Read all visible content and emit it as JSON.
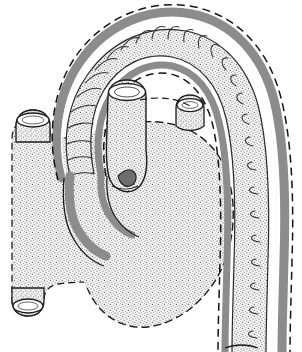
{
  "figure": {
    "title": "Anatomical line drawing of heart with aortic arch",
    "background_color": "#ffffff",
    "width": 302,
    "height": 352
  },
  "style": {
    "outline_color": "#1a1a1a",
    "vessel_wall_gray": "#8f8f8f",
    "vessel_wall_gray_dark": "#7a7a7a",
    "stipple_color": "#6b6b6b",
    "stipple_background": "#f2f2f2",
    "dashed_outline_color": "#141414",
    "rung_color": "#3a3a3a",
    "line_width_outline": 1.4,
    "line_width_rung": 1.0,
    "dash_pattern": "7,4"
  },
  "structures": [
    {
      "id": "heart-body",
      "label": "Heart chamber body",
      "fill": "stipple",
      "outline": "dashed",
      "description": "Large stippled silhouette occupying the left and lower-centre of the frame"
    },
    {
      "id": "left-upper-stump",
      "label": "Upper left vessel stump",
      "fill": "stipple",
      "outline": "dashed",
      "description": "Short tubular cut stump projecting from upper left of heart with elliptical open end"
    },
    {
      "id": "left-lower-stump",
      "label": "Lower left vessel stump",
      "fill": "stipple",
      "outline": "dashed",
      "description": "Short tubular cut stump projecting from lower left of heart with elliptical open end"
    },
    {
      "id": "pulmonary-trunk",
      "label": "Central cut vessel trunk",
      "fill": "stipple",
      "outline": "solid",
      "description": "Vertical cylindrical vessel in centre with elliptical cut opening at its top"
    },
    {
      "id": "right-upper-stump",
      "label": "Right upper vessel stump",
      "fill": "stipple",
      "outline": "solid",
      "description": "Small tubular cut stump at upper right of heart body"
    },
    {
      "id": "aortic-arch",
      "label": "Aortic arch and descending aorta",
      "fill": "stipple-with-rungs",
      "outline": "dashed-gray-band",
      "description": "Large ribbed arch sweeping from behind the heart up over the top and down the right side, ending at the lower right frame edge"
    }
  ],
  "aorta": {
    "segment_count": 26,
    "wall_band": "gray",
    "has_dashed_border": true,
    "has_ladder_rungs": true,
    "open_cut_end": "bottom-right"
  }
}
